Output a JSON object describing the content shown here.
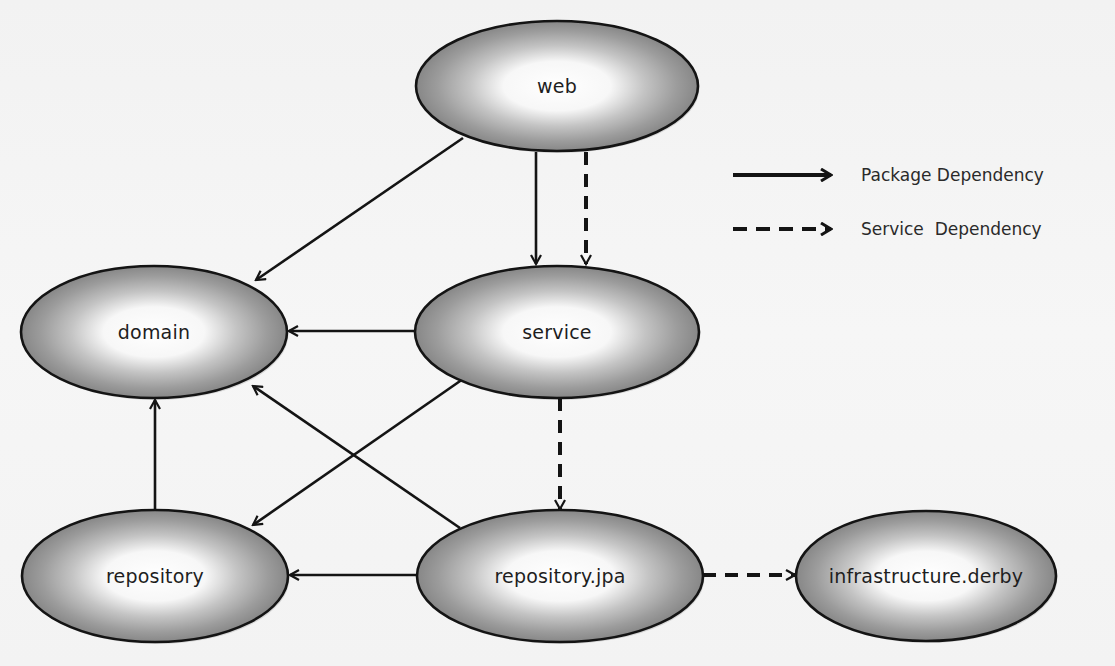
{
  "diagram": {
    "type": "package-dependency-graph",
    "nodes": [
      {
        "id": "web",
        "label": "web",
        "cx": 557,
        "cy": 86,
        "rx": 141,
        "ry": 65
      },
      {
        "id": "domain",
        "label": "domain",
        "cx": 154,
        "cy": 332,
        "rx": 133,
        "ry": 66
      },
      {
        "id": "service",
        "label": "service",
        "cx": 557,
        "cy": 332,
        "rx": 142,
        "ry": 66
      },
      {
        "id": "repository",
        "label": "repository",
        "cx": 155,
        "cy": 576,
        "rx": 133,
        "ry": 66
      },
      {
        "id": "repository_jpa",
        "label": "repository.jpa",
        "cx": 560,
        "cy": 576,
        "rx": 143,
        "ry": 66
      },
      {
        "id": "infrastructure_derby",
        "label": "infrastructure.derby",
        "cx": 926,
        "cy": 576,
        "rx": 130,
        "ry": 65
      }
    ],
    "edges": [
      {
        "from": "web",
        "to": "domain",
        "kind": "package",
        "x1": 463,
        "y1": 138,
        "x2": 256,
        "y2": 280
      },
      {
        "from": "web",
        "to": "service",
        "kind": "package",
        "x1": 536,
        "y1": 152,
        "x2": 536,
        "y2": 264
      },
      {
        "from": "web",
        "to": "service",
        "kind": "service",
        "x1": 586,
        "y1": 152,
        "x2": 586,
        "y2": 264
      },
      {
        "from": "service",
        "to": "domain",
        "kind": "package",
        "x1": 415,
        "y1": 331,
        "x2": 289,
        "y2": 331
      },
      {
        "from": "service",
        "to": "repository",
        "kind": "package",
        "x1": 463,
        "y1": 379,
        "x2": 253,
        "y2": 525
      },
      {
        "from": "service",
        "to": "repository_jpa",
        "kind": "service",
        "x1": 560,
        "y1": 398,
        "x2": 560,
        "y2": 509
      },
      {
        "from": "repository_jpa",
        "to": "domain",
        "kind": "package",
        "x1": 460,
        "y1": 528,
        "x2": 253,
        "y2": 386
      },
      {
        "from": "repository_jpa",
        "to": "repository",
        "kind": "package",
        "x1": 416,
        "y1": 575,
        "x2": 290,
        "y2": 575
      },
      {
        "from": "repository",
        "to": "domain",
        "kind": "package",
        "x1": 155,
        "y1": 510,
        "x2": 155,
        "y2": 400
      },
      {
        "from": "repository_jpa",
        "to": "infrastructure_derby",
        "kind": "service",
        "x1": 703,
        "y1": 575,
        "x2": 795,
        "y2": 575
      }
    ]
  },
  "legend": {
    "items": [
      {
        "kind": "package",
        "label": "Package Dependency",
        "y": 175
      },
      {
        "kind": "service",
        "label": "Service  Dependency",
        "y": 229
      }
    ]
  },
  "colors": {
    "stroke": "#141414",
    "fill_center": "#ffffff",
    "fill_edge": "#8c8c8c",
    "label": "#1e1e1e",
    "background": "#f4f4f4"
  }
}
